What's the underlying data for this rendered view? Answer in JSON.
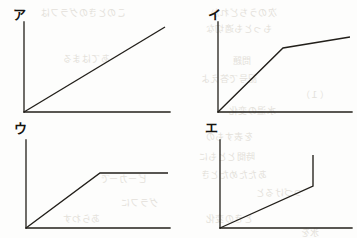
{
  "figure": {
    "title": "",
    "background_color": "#fdfdfc",
    "ink_color": "#221f1a",
    "panel_count": 4,
    "layout": "2x2 grid of line-graph sketches"
  },
  "panels": [
    {
      "key": "a",
      "label": "ア",
      "label_romaji": "a",
      "position": "top-left",
      "shape": "straight increasing line from origin",
      "description": "Single straight line rising at a constant slope from the origin to the upper right.",
      "label_pos": {
        "x": 13,
        "y": 8
      },
      "axes": {
        "origin_x": 24,
        "origin_y": 112,
        "y_top": 22,
        "x_right": 170
      },
      "points": [
        {
          "x": 24,
          "y": 112
        },
        {
          "x": 165,
          "y": 27
        }
      ]
    },
    {
      "key": "i",
      "label": "イ",
      "label_romaji": "i",
      "position": "top-right",
      "shape": "steep rise then shallow rise",
      "description": "Steep straight rise from the origin which bends at a knee and continues rising with a much smaller slope.",
      "label_pos": {
        "x": 208,
        "y": 8
      },
      "axes": {
        "origin_x": 218,
        "origin_y": 112,
        "y_top": 22,
        "x_right": 352
      },
      "points": [
        {
          "x": 218,
          "y": 112
        },
        {
          "x": 283,
          "y": 48
        },
        {
          "x": 350,
          "y": 37
        }
      ]
    },
    {
      "key": "u",
      "label": "ウ",
      "label_romaji": "u",
      "position": "bottom-left",
      "shape": "linear rise then flat plateau",
      "description": "Straight rise from the origin that levels off into a horizontal plateau.",
      "label_pos": {
        "x": 14,
        "y": 122
      },
      "axes": {
        "origin_x": 26,
        "origin_y": 228,
        "y_top": 140,
        "x_right": 170
      },
      "points": [
        {
          "x": 26,
          "y": 228
        },
        {
          "x": 100,
          "y": 173
        },
        {
          "x": 168,
          "y": 173
        }
      ]
    },
    {
      "key": "e",
      "label": "エ",
      "label_romaji": "e",
      "position": "bottom-right",
      "shape": "gradual rise then vertical jump",
      "description": "Gentle straight rise from the origin followed by an abrupt vertical jump at the right end.",
      "label_pos": {
        "x": 205,
        "y": 121
      },
      "axes": {
        "origin_x": 220,
        "origin_y": 228,
        "y_top": 140,
        "x_right": 352
      },
      "points": [
        {
          "x": 220,
          "y": 228
        },
        {
          "x": 313,
          "y": 186
        },
        {
          "x": 313,
          "y": 155
        }
      ]
    }
  ],
  "bleed_through_text": [
    {
      "text": "このときのグラフは",
      "x": 40,
      "y": 6,
      "size": 9
    },
    {
      "text": "次のうちどれか",
      "x": 210,
      "y": 6,
      "size": 9
    },
    {
      "text": "もっとも適切な",
      "x": 205,
      "y": 22,
      "size": 9
    },
    {
      "text": "あてはまる",
      "x": 62,
      "y": 52,
      "size": 9
    },
    {
      "text": "問題",
      "x": 232,
      "y": 54,
      "size": 9
    },
    {
      "text": "記号で答えよ",
      "x": 200,
      "y": 72,
      "size": 9
    },
    {
      "text": "（１）",
      "x": 300,
      "y": 88,
      "size": 9
    },
    {
      "text": "水温の変化",
      "x": 228,
      "y": 104,
      "size": 9
    },
    {
      "text": "を表すもの",
      "x": 205,
      "y": 130,
      "size": 9
    },
    {
      "text": "時間とともに",
      "x": 198,
      "y": 150,
      "size": 9
    },
    {
      "text": "あたためたとき",
      "x": 200,
      "y": 168,
      "size": 9
    },
    {
      "text": "ビーカーで",
      "x": 100,
      "y": 172,
      "size": 9
    },
    {
      "text": "つづけると",
      "x": 255,
      "y": 186,
      "size": 9
    },
    {
      "text": "グラフに",
      "x": 120,
      "y": 196,
      "size": 9
    },
    {
      "text": "あらわす",
      "x": 62,
      "y": 212,
      "size": 9
    },
    {
      "text": "ときの変化",
      "x": 205,
      "y": 212,
      "size": 9
    },
    {
      "text": "氷を",
      "x": 300,
      "y": 226,
      "size": 9
    }
  ]
}
